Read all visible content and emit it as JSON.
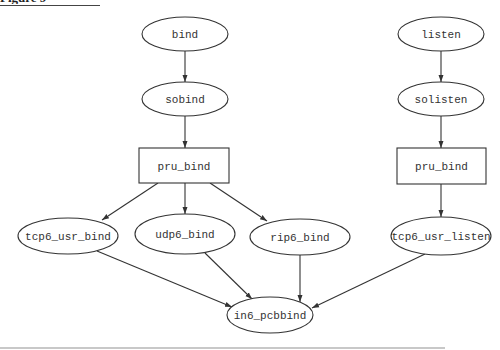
{
  "figure": {
    "title_cropped": "Figure 9"
  },
  "diagram": {
    "type": "call-graph",
    "colors": {
      "stroke": "#333333",
      "text": "#333333",
      "background": "#ffffff"
    },
    "nodes": [
      {
        "id": "bind",
        "label": "bind",
        "shape": "ellipse",
        "cx": 185,
        "cy": 34,
        "rx": 43,
        "ry": 17
      },
      {
        "id": "sobind",
        "label": "sobind",
        "shape": "ellipse",
        "cx": 185,
        "cy": 99,
        "rx": 43,
        "ry": 17
      },
      {
        "id": "pru_bind_left",
        "label": "pru_bind",
        "shape": "box",
        "x": 139,
        "y": 148,
        "w": 90,
        "h": 35
      },
      {
        "id": "tcp6_usr_bind",
        "label": "tcp6_usr_bind",
        "shape": "ellipse",
        "cx": 68,
        "cy": 236,
        "rx": 50,
        "ry": 18
      },
      {
        "id": "udp6_bind",
        "label": "udp6_bind",
        "shape": "ellipse",
        "cx": 185,
        "cy": 234,
        "rx": 50,
        "ry": 20
      },
      {
        "id": "rip6_bind",
        "label": "rip6_bind",
        "shape": "ellipse",
        "cx": 300,
        "cy": 237,
        "rx": 50,
        "ry": 18
      },
      {
        "id": "in6_pcbbind",
        "label": "in6_pcbbind",
        "shape": "ellipse",
        "cx": 270,
        "cy": 315,
        "rx": 43,
        "ry": 18
      },
      {
        "id": "listen",
        "label": "listen",
        "shape": "ellipse",
        "cx": 441,
        "cy": 34,
        "rx": 43,
        "ry": 17
      },
      {
        "id": "solisten",
        "label": "solisten",
        "shape": "ellipse",
        "cx": 441,
        "cy": 99,
        "rx": 43,
        "ry": 17
      },
      {
        "id": "pru_bind_right",
        "label": "pru_bind",
        "shape": "box",
        "x": 397,
        "y": 148,
        "w": 89,
        "h": 36
      },
      {
        "id": "tcp6_usr_listen",
        "label": "tcp6_usr_listen",
        "shape": "ellipse",
        "cx": 441,
        "cy": 236,
        "rx": 50,
        "ry": 19
      }
    ],
    "edges": [
      {
        "from": "bind",
        "to": "sobind",
        "x1": 185,
        "y1": 51,
        "x2": 185,
        "y2": 82
      },
      {
        "from": "sobind",
        "to": "pru_bind_left",
        "x1": 185,
        "y1": 116,
        "x2": 185,
        "y2": 148
      },
      {
        "from": "pru_bind_left",
        "to": "tcp6_usr_bind",
        "x1": 158,
        "y1": 183,
        "x2": 102,
        "y2": 220
      },
      {
        "from": "pru_bind_left",
        "to": "udp6_bind",
        "x1": 185,
        "y1": 183,
        "x2": 185,
        "y2": 214
      },
      {
        "from": "pru_bind_left",
        "to": "rip6_bind",
        "x1": 210,
        "y1": 183,
        "x2": 267,
        "y2": 221
      },
      {
        "from": "tcp6_usr_bind",
        "to": "in6_pcbbind",
        "x1": 97,
        "y1": 251,
        "x2": 232,
        "y2": 307
      },
      {
        "from": "udp6_bind",
        "to": "in6_pcbbind",
        "x1": 205,
        "y1": 253,
        "x2": 252,
        "y2": 299
      },
      {
        "from": "rip6_bind",
        "to": "in6_pcbbind",
        "x1": 300,
        "y1": 255,
        "x2": 300,
        "y2": 302
      },
      {
        "from": "tcp6_usr_listen",
        "to": "in6_pcbbind",
        "x1": 425,
        "y1": 254,
        "x2": 312,
        "y2": 308
      },
      {
        "from": "listen",
        "to": "solisten",
        "x1": 441,
        "y1": 51,
        "x2": 441,
        "y2": 82
      },
      {
        "from": "solisten",
        "to": "pru_bind_right",
        "x1": 441,
        "y1": 116,
        "x2": 441,
        "y2": 148
      },
      {
        "from": "pru_bind_right",
        "to": "tcp6_usr_listen",
        "x1": 441,
        "y1": 184,
        "x2": 441,
        "y2": 217
      }
    ]
  }
}
